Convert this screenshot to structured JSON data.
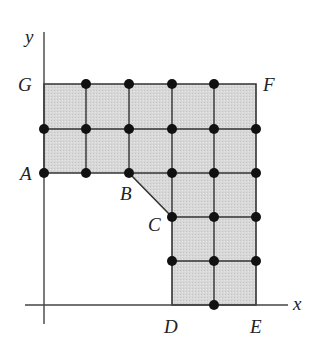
{
  "diagram": {
    "type": "lattice-region",
    "axes": {
      "x_label": "x",
      "y_label": "y"
    },
    "colors": {
      "fill": "#d6d6d6",
      "stroke": "#333333",
      "dot": "#111111",
      "axis": "#444444"
    },
    "vertices": [
      {
        "label": "G",
        "grid": [
          0,
          5
        ]
      },
      {
        "label": "F",
        "grid": [
          5,
          5
        ]
      },
      {
        "label": "E",
        "grid": [
          5,
          0
        ]
      },
      {
        "label": "D",
        "grid": [
          3,
          0
        ]
      },
      {
        "label": "C",
        "grid": [
          3,
          2
        ]
      },
      {
        "label": "B",
        "grid": [
          2,
          3
        ]
      },
      {
        "label": "A",
        "grid": [
          0,
          3
        ]
      }
    ],
    "boundary_order": [
      "A",
      "G",
      "F",
      "E",
      "D",
      "C",
      "B"
    ],
    "lattice_points_marked": [
      [
        1,
        5
      ],
      [
        2,
        5
      ],
      [
        3,
        5
      ],
      [
        4,
        5
      ],
      [
        0,
        4
      ],
      [
        1,
        4
      ],
      [
        2,
        4
      ],
      [
        3,
        4
      ],
      [
        4,
        4
      ],
      [
        5,
        4
      ],
      [
        0,
        3
      ],
      [
        1,
        3
      ],
      [
        2,
        3
      ],
      [
        3,
        3
      ],
      [
        4,
        3
      ],
      [
        5,
        3
      ],
      [
        3,
        2
      ],
      [
        4,
        2
      ],
      [
        5,
        2
      ],
      [
        3,
        1
      ],
      [
        4,
        1
      ],
      [
        5,
        1
      ],
      [
        4,
        0
      ]
    ]
  }
}
